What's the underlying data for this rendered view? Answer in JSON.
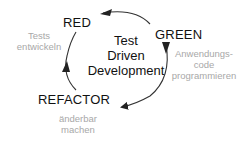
{
  "diagram": {
    "title": "Test Driven Development",
    "center_lines": [
      "Test",
      "Driven",
      "Development"
    ],
    "stages": [
      {
        "id": "red",
        "label": "RED",
        "note_lines": [
          "Tests",
          "entwickeln"
        ]
      },
      {
        "id": "green",
        "label": "GREEN",
        "note_lines": [
          "Anwendungs-",
          "code",
          "programmieren"
        ]
      },
      {
        "id": "refactor",
        "label": "REFACTOR",
        "note_lines": [
          "änderbar",
          "machen"
        ]
      }
    ],
    "flow": [
      "RED",
      "GREEN",
      "REFACTOR",
      "RED"
    ],
    "colors": {
      "stage_text": "#111111",
      "note_text": "#a8a8a8",
      "arrow": "#222222",
      "background": "#ffffff"
    }
  }
}
